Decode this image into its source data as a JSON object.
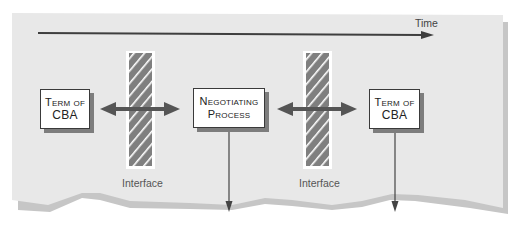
{
  "diagram": {
    "timeline_label": "Time",
    "boxes": [
      {
        "id": "term-of-cba-1",
        "line1": "Term of",
        "line2": "CBA"
      },
      {
        "id": "negotiating-process",
        "line1": "Negotiating",
        "line2": "Process"
      },
      {
        "id": "term-of-cba-2",
        "line1": "Term of",
        "line2": "CBA"
      }
    ],
    "interfaces": [
      {
        "label": "Interface"
      },
      {
        "label": "Interface"
      }
    ]
  },
  "colors": {
    "panel": "#e8e8e8",
    "panel_shadow": "#c4c4c4",
    "arrow": "#5a5a5a",
    "hatch": "#7f7f7f",
    "box_border": "#3a3a3a",
    "box_shadow": "#7d7d7d"
  }
}
